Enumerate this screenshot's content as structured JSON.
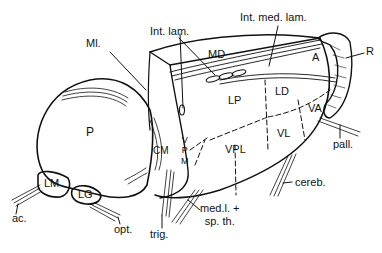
{
  "figure": {
    "labels": {
      "ml": "Ml.",
      "int_lam": "Int. lam.",
      "int_med_lam": "Int. med. lam.",
      "md": "MD",
      "a": "A",
      "r": "R",
      "lp": "LP",
      "ld": "LD",
      "va": "VA",
      "vl": "VL",
      "vpl": "VPL",
      "vpm": "V\nP\nM",
      "cm": "CM",
      "p": "P",
      "lm": "LM",
      "lg": "LG",
      "ac": "ac.",
      "opt": "opt.",
      "trig": "trig.",
      "med_sp": "med.l. +\nsp. th.",
      "cereb": "cereb.",
      "pall": "pall."
    },
    "colors": {
      "stroke": "#111111",
      "background": "#ffffff"
    }
  }
}
